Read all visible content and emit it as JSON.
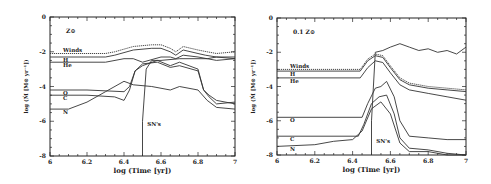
{
  "chart_data": [
    {
      "type": "line",
      "panel_label": "Z⊙",
      "xlabel": "log (Time [yr])",
      "ylabel": "log (Ṁ [M⊙ yr⁻¹])",
      "xlim": [
        6,
        7
      ],
      "ylim": [
        -8,
        0
      ],
      "xticks": [
        "6",
        "6.2",
        "6.4",
        "6.6",
        "6.8",
        "7"
      ],
      "yticks": [
        "0",
        "-2",
        "-4",
        "-6",
        "-8"
      ],
      "grid": false,
      "annotations": [
        {
          "text": "SN's",
          "x": 6.52,
          "y": -6.3
        }
      ],
      "series": [
        {
          "name": "Winds",
          "style": "dotted",
          "x": [
            6.0,
            6.3,
            6.35,
            6.45,
            6.55,
            6.6,
            6.65,
            6.68,
            6.72,
            6.8,
            6.85,
            6.9,
            7.0
          ],
          "y": [
            -2.1,
            -2.1,
            -2.0,
            -1.7,
            -1.6,
            -1.6,
            -1.8,
            -2.0,
            -1.7,
            -1.9,
            -2.0,
            -2.1,
            -2.0
          ]
        },
        {
          "name": "H",
          "style": "solid",
          "x": [
            6.0,
            6.3,
            6.35,
            6.45,
            6.55,
            6.6,
            6.65,
            6.68,
            6.72,
            6.8,
            6.84,
            6.9,
            7.0
          ],
          "y": [
            -2.3,
            -2.3,
            -2.2,
            -1.9,
            -1.8,
            -1.8,
            -2.0,
            -2.2,
            -1.9,
            -2.1,
            -2.2,
            -2.3,
            -2.4
          ]
        },
        {
          "name": "He",
          "style": "solid",
          "x": [
            6.0,
            6.3,
            6.4,
            6.45,
            6.5,
            6.6,
            6.65,
            6.68,
            6.72,
            6.8,
            6.85,
            6.9,
            7.0
          ],
          "y": [
            -2.6,
            -2.6,
            -2.4,
            -2.4,
            -2.6,
            -2.3,
            -2.3,
            -2.4,
            -2.2,
            -2.3,
            -2.4,
            -2.5,
            -2.4
          ]
        },
        {
          "name": "O",
          "style": "solid",
          "x": [
            6.0,
            6.2,
            6.4,
            6.43,
            6.46,
            6.5,
            6.58,
            6.65,
            6.7,
            6.8,
            6.83,
            6.86,
            6.9,
            7.0
          ],
          "y": [
            -4.2,
            -4.2,
            -4.3,
            -4.0,
            -3.1,
            -2.8,
            -2.5,
            -2.8,
            -2.6,
            -3.0,
            -4.2,
            -4.6,
            -5.0,
            -4.9
          ]
        },
        {
          "name": "C",
          "style": "solid",
          "x": [
            6.0,
            6.2,
            6.35,
            6.4,
            6.43,
            6.46,
            6.5,
            6.58,
            6.65,
            6.7,
            6.8,
            6.83,
            6.86,
            6.9,
            7.0
          ],
          "y": [
            -4.5,
            -4.5,
            -4.6,
            -4.8,
            -4.2,
            -3.1,
            -2.7,
            -2.6,
            -2.9,
            -2.8,
            -3.1,
            -4.2,
            -4.5,
            -4.8,
            -5.0
          ]
        },
        {
          "name": "N",
          "style": "solid",
          "x": [
            6.0,
            6.1,
            6.2,
            6.3,
            6.4,
            6.45,
            6.55,
            6.65,
            6.7,
            6.8,
            6.85,
            6.9,
            7.0
          ],
          "y": [
            -5.3,
            -5.3,
            -4.9,
            -4.3,
            -3.7,
            -3.9,
            -4.0,
            -4.2,
            -4.0,
            -4.2,
            -4.8,
            -5.2,
            -5.3
          ]
        },
        {
          "name": "SN's",
          "style": "solid",
          "x": [
            6.5,
            6.5,
            6.52,
            6.55,
            6.6,
            6.7,
            6.8,
            6.85,
            6.9,
            7.0
          ],
          "y": [
            -8.0,
            -6.0,
            -3.0,
            -2.5,
            -2.5,
            -2.4,
            -2.4,
            -2.4,
            -2.3,
            -2.3
          ]
        }
      ]
    },
    {
      "type": "line",
      "panel_label": "0.1 Z⊙",
      "xlabel": "log (Time [yr])",
      "ylabel": "log (Ṁ [M⊙ yr⁻¹])",
      "xlim": [
        6,
        7
      ],
      "ylim": [
        -8,
        0
      ],
      "xticks": [
        "6",
        "6.2",
        "6.4",
        "6.6",
        "6.8",
        "7"
      ],
      "yticks": [
        "0",
        "-2",
        "-4",
        "-6",
        "-8"
      ],
      "grid": false,
      "annotations": [
        {
          "text": "SN's",
          "x": 6.52,
          "y": -7.3
        }
      ],
      "series": [
        {
          "name": "Winds",
          "style": "dotted",
          "x": [
            6.0,
            6.44,
            6.48,
            6.52,
            6.56,
            6.6,
            6.65,
            6.7,
            6.8,
            6.9,
            7.0
          ],
          "y": [
            -3.0,
            -3.0,
            -2.4,
            -2.1,
            -2.2,
            -2.8,
            -3.5,
            -3.8,
            -4.0,
            -4.1,
            -4.2
          ]
        },
        {
          "name": "H",
          "style": "solid",
          "x": [
            6.0,
            6.44,
            6.48,
            6.52,
            6.56,
            6.6,
            6.65,
            6.7,
            6.8,
            6.9,
            7.0
          ],
          "y": [
            -3.1,
            -3.1,
            -2.5,
            -2.2,
            -2.3,
            -2.9,
            -3.6,
            -3.9,
            -4.1,
            -4.2,
            -4.3
          ]
        },
        {
          "name": "He",
          "style": "solid",
          "x": [
            6.0,
            6.44,
            6.48,
            6.52,
            6.56,
            6.6,
            6.65,
            6.7,
            6.8,
            6.9,
            7.0
          ],
          "y": [
            -3.5,
            -3.5,
            -2.9,
            -2.5,
            -2.6,
            -3.2,
            -3.9,
            -4.2,
            -4.4,
            -4.6,
            -4.8
          ]
        },
        {
          "name": "O",
          "style": "solid",
          "x": [
            6.0,
            6.45,
            6.48,
            6.52,
            6.55,
            6.58,
            6.62,
            6.65,
            6.7,
            6.8,
            6.9,
            7.0
          ],
          "y": [
            -5.8,
            -5.8,
            -5.0,
            -4.1,
            -4.0,
            -3.7,
            -4.6,
            -6.0,
            -6.9,
            -7.0,
            -7.1,
            -7.1
          ]
        },
        {
          "name": "C",
          "style": "solid",
          "x": [
            6.0,
            6.43,
            6.46,
            6.5,
            6.54,
            6.58,
            6.62,
            6.65,
            6.7,
            6.8,
            6.9,
            7.0
          ],
          "y": [
            -6.9,
            -6.9,
            -6.2,
            -5.0,
            -4.6,
            -4.5,
            -5.6,
            -7.0,
            -7.6,
            -7.7,
            -7.9,
            -8.0
          ]
        },
        {
          "name": "N",
          "style": "solid",
          "x": [
            6.0,
            6.2,
            6.3,
            6.4,
            6.45,
            6.5,
            6.55,
            6.6,
            6.65,
            6.7,
            6.8,
            6.9,
            7.0
          ],
          "y": [
            -7.5,
            -7.4,
            -7.2,
            -7.1,
            -6.6,
            -5.3,
            -4.9,
            -5.6,
            -7.3,
            -7.8,
            -7.8,
            -8.0,
            -8.0
          ]
        },
        {
          "name": "SN's",
          "style": "solid",
          "x": [
            6.5,
            6.5,
            6.52,
            6.56,
            6.6,
            6.65,
            6.7,
            6.75,
            6.8,
            6.85,
            6.9,
            6.95,
            7.0
          ],
          "y": [
            -8.0,
            -6.0,
            -2.0,
            -1.9,
            -1.7,
            -1.5,
            -1.7,
            -1.9,
            -1.8,
            -2.0,
            -1.9,
            -2.1,
            -1.7
          ]
        }
      ]
    }
  ],
  "panels": [
    {
      "label": "Z⊙",
      "xlabel": "log (Time [yr])",
      "ylabel": "log (Ṁ [M⊙ yr⁻¹])",
      "sn_label": "SN's",
      "series_labels": [
        "Winds",
        "H",
        "He",
        "O",
        "C",
        "N"
      ]
    },
    {
      "label": "0.1 Z⊙",
      "xlabel": "log (Time [yr])",
      "ylabel": "log (Ṁ [M⊙ yr⁻¹])",
      "sn_label": "SN's",
      "series_labels": [
        "Winds",
        "H",
        "He",
        "O",
        "C",
        "N"
      ]
    }
  ],
  "ticks": {
    "x": [
      "6",
      "6.2",
      "6.4",
      "6.6",
      "6.8",
      "7"
    ],
    "y": [
      "0",
      "-2",
      "-4",
      "-6",
      "-8"
    ]
  }
}
